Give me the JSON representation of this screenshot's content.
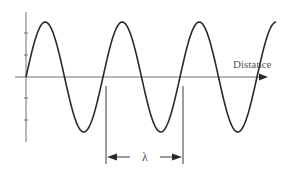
{
  "diagram": {
    "type": "transverse-wave",
    "x_axis_label": "Distance",
    "wavelength_symbol": "λ",
    "colors": {
      "wave": "#2a2a2a",
      "axis": "#707070",
      "dimension": "#3a3a3a",
      "text": "#555555"
    },
    "wave": {
      "cycles": 3.25,
      "x_start_px": 26,
      "wavelength_px": 77,
      "baseline_y_px": 77,
      "amplitude_px": 55
    },
    "y_axis_ticks_count": 4
  }
}
